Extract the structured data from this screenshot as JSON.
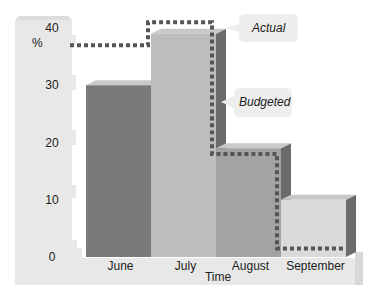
{
  "chart_data": {
    "type": "bar",
    "title": "",
    "xlabel": "Time",
    "ylabel": "%",
    "ylim": [
      0,
      40
    ],
    "yticks": [
      0,
      10,
      20,
      30,
      40
    ],
    "grid": false,
    "categories": [
      "June",
      "July",
      "August",
      "September"
    ],
    "series": [
      {
        "name": "Actual",
        "type": "bar",
        "values": [
          30,
          39,
          19,
          10
        ]
      },
      {
        "name": "Budgeted",
        "type": "step-line",
        "style": "dotted",
        "values": [
          37,
          41,
          18,
          1.5
        ]
      }
    ],
    "legend": [
      {
        "label": "Actual",
        "placement": "right, pointing at July bar top"
      },
      {
        "label": "Budgeted",
        "placement": "right, pointing at budgeted line"
      }
    ],
    "colors": {
      "bars": [
        "#7a7a7a",
        "#bdbdbd",
        "#a3a3a3",
        "#dadada"
      ],
      "bar_side": "#6b6b6b",
      "budgeted_line": "#555555",
      "axis_panel": "#e6e6e6",
      "callout_bg": "#eeeeee"
    }
  }
}
